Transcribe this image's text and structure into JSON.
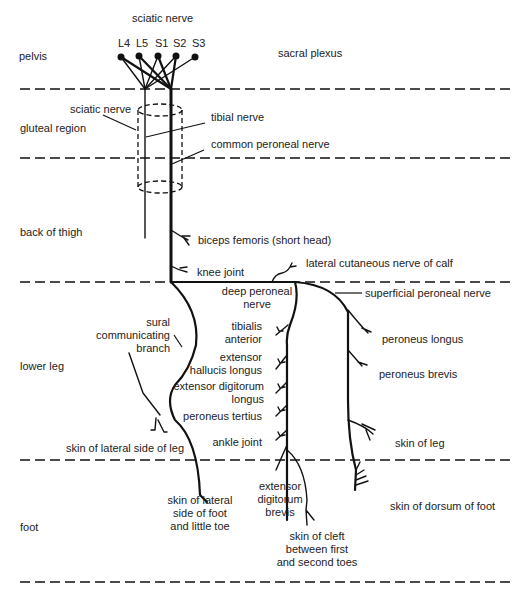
{
  "title": "sciatic nerve",
  "regions": [
    {
      "id": "pelvis",
      "label": "pelvis"
    },
    {
      "id": "gluteal",
      "label": "gluteal region"
    },
    {
      "id": "thigh",
      "label": "back of thigh"
    },
    {
      "id": "lower-leg",
      "label": "lower leg"
    },
    {
      "id": "foot",
      "label": "foot"
    }
  ],
  "roots": [
    "L4",
    "L5",
    "S1",
    "S2",
    "S3"
  ],
  "labels": {
    "sacral_plexus": "sacral plexus",
    "sciatic_nerve": "sciatic nerve",
    "tibial_nerve": "tibial nerve",
    "common_peroneal_nerve": "common peroneal nerve",
    "biceps_femoris": "biceps femoris (short head)",
    "knee_joint": "knee joint",
    "lateral_cutaneous_calf": "lateral cutaneous nerve of calf",
    "deep_peroneal_1": "deep peroneal",
    "deep_peroneal_2": "nerve",
    "superficial_peroneal": "superficial  peroneal nerve",
    "sural_1": "sural",
    "sural_2": "communicating",
    "sural_3": "branch",
    "tibialis_1": "tibialis",
    "tibialis_2": "anterior",
    "ehl_1": "extensor",
    "ehl_2": "hallucis longus",
    "edl_1": "extensor digitorum",
    "edl_2": "longus",
    "peroneus_tertius": "peroneus tertius",
    "ankle_joint": "ankle joint",
    "peroneus_longus": "peroneus longus",
    "peroneus_brevis": "peroneus brevis",
    "skin_of_leg": "skin of leg",
    "skin_lateral_leg": "skin of lateral side of leg",
    "skin_lateral_foot_1": "skin of lateral",
    "skin_lateral_foot_2": "side of foot",
    "skin_lateral_foot_3": "and little toe",
    "edb_1": "extensor",
    "edb_2": "digitorum",
    "edb_3": "brevis",
    "skin_cleft_1": "skin of cleft",
    "skin_cleft_2": "between first",
    "skin_cleft_3": "and second toes",
    "skin_dorsum_foot": "skin of dorsum of foot"
  }
}
